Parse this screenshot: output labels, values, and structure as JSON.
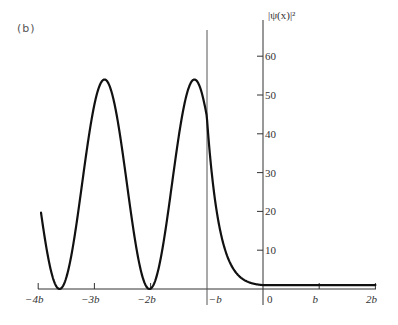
{
  "panel_label": "(b)",
  "chart_data": {
    "type": "line",
    "title": "",
    "panel": "(b)",
    "xlabel": "",
    "ylabel": "|ψ(x)|²",
    "x_unit": "b",
    "xlim": [
      -4,
      2
    ],
    "ylim": [
      0,
      60
    ],
    "grid": false,
    "legend": null,
    "x_ticks": [
      -4,
      -3,
      -2,
      -1,
      0,
      1,
      2
    ],
    "x_tick_labels": [
      "−4b",
      "−3b",
      "−2b",
      "−b",
      "0",
      "b",
      "2b"
    ],
    "y_ticks": [
      10,
      20,
      30,
      40,
      50,
      60
    ],
    "y_tick_labels": [
      "10",
      "20",
      "30",
      "40",
      "50",
      "60"
    ],
    "annotations": [
      {
        "type": "vertical_line",
        "x": -1,
        "label": "boundary at x = −b"
      }
    ],
    "series": [
      {
        "name": "|ψ(x)|²",
        "description": "oscillatory (sin²-like) for x < −b, exponential decay for −b < x < 0, constant ≈1 for x > 0",
        "x": [
          -3.95,
          -3.8,
          -3.65,
          -3.5,
          -3.35,
          -3.2,
          -3.05,
          -2.9,
          -2.75,
          -2.6,
          -2.45,
          -2.3,
          -2.15,
          -2.0,
          -1.85,
          -1.7,
          -1.55,
          -1.4,
          -1.25,
          -1.1,
          -1.0,
          -0.8,
          -0.6,
          -0.4,
          -0.2,
          0.0,
          0.5,
          1.0,
          1.5,
          2.0
        ],
        "y": [
          13,
          5,
          0,
          8,
          28,
          46,
          54,
          50,
          36,
          18,
          4,
          0,
          6,
          22,
          40,
          52,
          54,
          45,
          30,
          29,
          25,
          15,
          8,
          4,
          2,
          1,
          1,
          1,
          1,
          1
        ]
      }
    ]
  }
}
